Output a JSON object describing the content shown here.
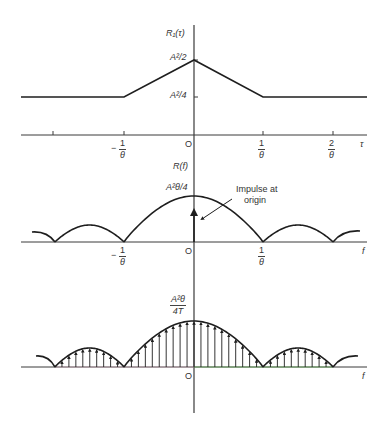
{
  "figure": {
    "width": 391,
    "height": 432,
    "colors": {
      "ink": "#1e1e1e",
      "axis": "#3a3a3a",
      "label": "#333333",
      "axis_tint_green": "#5aa84a",
      "axis_tint_pink": "#c8a0b0"
    },
    "vertical_axis": {
      "x": 194,
      "y_top": 25,
      "y_bottom": 413
    }
  },
  "panel_top": {
    "ylabel": "R₁(τ)",
    "xlabel": "τ",
    "origin_label": "O",
    "peak_label": "A²/2",
    "floor_label": "A²/4",
    "tick_labels": [
      {
        "neg": true,
        "num": "1",
        "den": "θ"
      },
      {
        "neg": false,
        "num": "1",
        "den": "θ"
      },
      {
        "neg": false,
        "num": "2",
        "den": "θ"
      }
    ]
  },
  "panel_middle": {
    "ylabel": "R(f)",
    "xlabel": "f",
    "origin_label": "O",
    "peak_label": "A²θ/4",
    "annotation_line1": "Impulse at",
    "annotation_line2": "origin",
    "tick_labels": [
      {
        "neg": true,
        "num": "1",
        "den": "θ"
      },
      {
        "neg": false,
        "num": "1",
        "den": "θ"
      }
    ]
  },
  "panel_bottom": {
    "xlabel": "f",
    "origin_label": "O",
    "peak_label_num": "A²θ",
    "peak_label_den": "4T"
  },
  "chart_data": [
    {
      "type": "line",
      "title": "Autocorrelation R1(tau)",
      "xlabel": "τ",
      "ylabel": "R₁(τ)",
      "x_ticks": [
        "-2/θ",
        "-1/θ",
        "0",
        "1/θ",
        "2/θ"
      ],
      "x": [
        -3,
        -1,
        0,
        1,
        3
      ],
      "y": [
        0.25,
        0.25,
        0.5,
        0.25,
        0.25
      ],
      "y_units": "A²",
      "y_tick_labels": [
        "A²/4",
        "A²/2"
      ],
      "grid": false
    },
    {
      "type": "line",
      "title": "Power spectral density R(f)",
      "xlabel": "f",
      "ylabel": "R(f)",
      "shape": "sinc-squared lobes with nulls at multiples of 1/θ, plus impulse at origin",
      "nulls": [
        "-2/θ",
        "-1/θ",
        "1/θ",
        "2/θ"
      ],
      "peak_value": "A²θ/4",
      "annotations": [
        "Impulse at origin"
      ],
      "grid": false
    },
    {
      "type": "bar",
      "title": "Line spectrum (sampled PSD)",
      "xlabel": "f",
      "shape": "discrete impulses spaced 1/T under sinc-squared envelope",
      "peak_value": "A²θ/(4T)",
      "grid": false
    }
  ],
  "geometry": {
    "top": {
      "axis_y": 135,
      "axis_x1": 21,
      "axis_x2": 367,
      "floor_y": 97,
      "peak_y": 60,
      "ticks_x": [
        53,
        124,
        263,
        333
      ],
      "tri_x": [
        124,
        194,
        263
      ]
    },
    "middle": {
      "axis_y": 242,
      "axis_x1": 21,
      "axis_x2": 367,
      "nulls_x": [
        55,
        124,
        263,
        333
      ],
      "main_peak_y": 196,
      "side_peak_y": 225,
      "left_edge": [
        32,
        232
      ],
      "right_edge": [
        360,
        231
      ],
      "impulse_top_y": 212
    },
    "bottom": {
      "axis_y": 367,
      "axis_x1": 21,
      "axis_x2": 367,
      "nulls_x": [
        55,
        124,
        263,
        333
      ],
      "main_peak_y": 321,
      "side_peak_y": 348,
      "left_edge": [
        36,
        356
      ],
      "right_edge": [
        358,
        356
      ],
      "arrow_spacing": 6.95
    }
  }
}
